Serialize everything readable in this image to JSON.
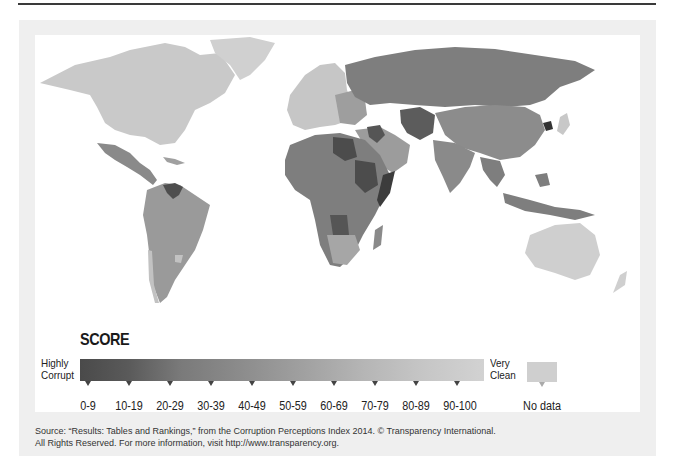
{
  "legend": {
    "title": "SCORE",
    "left_label_line1": "Highly",
    "left_label_line2": "Corrupt",
    "right_label_line1": "Very",
    "right_label_line2": "Clean",
    "ranges": [
      "0-9",
      "10-19",
      "20-29",
      "30-39",
      "40-49",
      "50-59",
      "60-69",
      "70-79",
      "80-89",
      "90-100"
    ],
    "no_data_label": "No data",
    "colors": {
      "most_corrupt": "#4a4a4a",
      "cleanest": "#d2d2d2",
      "no_data": "#cfcfcf"
    }
  },
  "source": {
    "line1": "Source: “Results: Tables and Rankings,” from the Corruption Perceptions Index 2014. © Transparency International.",
    "line2": "All Rights Reserved. For more information, visit http://www.transparency.org."
  },
  "map": {
    "description": "World map shaded by Corruption Perceptions Index 2014 score",
    "regions": [
      {
        "name": "North America (Canada/USA)",
        "shade": "#c9c9c9"
      },
      {
        "name": "Greenland",
        "shade": "#d0d0d0"
      },
      {
        "name": "Mexico/Central America",
        "shade": "#8a8a8a"
      },
      {
        "name": "Venezuela",
        "shade": "#4e4e4e"
      },
      {
        "name": "South America",
        "shade": "#9a9a9a"
      },
      {
        "name": "Chile/Uruguay",
        "shade": "#c2c2c2"
      },
      {
        "name": "Western/Northern Europe",
        "shade": "#c6c6c6"
      },
      {
        "name": "Russia",
        "shade": "#7e7e7e"
      },
      {
        "name": "Central Asia",
        "shade": "#5c5c5c"
      },
      {
        "name": "China",
        "shade": "#8c8c8c"
      },
      {
        "name": "North Korea",
        "shade": "#333333"
      },
      {
        "name": "Japan",
        "shade": "#c8c8c8"
      },
      {
        "name": "India/South Asia",
        "shade": "#8a8a8a"
      },
      {
        "name": "Middle East",
        "shade": "#9c9c9c"
      },
      {
        "name": "Libya/Sudan/Somalia",
        "shade": "#4c4c4c"
      },
      {
        "name": "Africa",
        "shade": "#7e7e7e"
      },
      {
        "name": "Angola",
        "shade": "#555555"
      },
      {
        "name": "Southern Africa",
        "shade": "#a6a6a6"
      },
      {
        "name": "Southeast Asia",
        "shade": "#7e7e7e"
      },
      {
        "name": "Australia/New Zealand",
        "shade": "#cfcfcf"
      }
    ]
  }
}
